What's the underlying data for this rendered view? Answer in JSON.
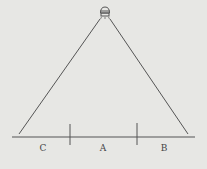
{
  "diagram": {
    "type": "light-source-illumination",
    "colors": {
      "background": "#e7e7e4",
      "line": "#555555",
      "label": "#444444"
    },
    "light_source": {
      "icon": "lamp-icon",
      "x": 105,
      "y": 12
    },
    "rays": [
      {
        "name": "left-ray",
        "x1": 100,
        "y1": 19,
        "x2": 19,
        "y2": 134
      },
      {
        "name": "right-ray",
        "x1": 110,
        "y1": 19,
        "x2": 188,
        "y2": 134
      }
    ],
    "baseline": {
      "x1": 12,
      "y1": 137,
      "x2": 195,
      "y2": 137
    },
    "ticks": [
      {
        "x": 70,
        "y1": 124,
        "y2": 145
      },
      {
        "x": 137,
        "y1": 123,
        "y2": 145
      }
    ],
    "regions": [
      {
        "label": "C",
        "x": 43,
        "y": 144
      },
      {
        "label": "A",
        "x": 103,
        "y": 144
      },
      {
        "label": "B",
        "x": 164,
        "y": 144
      }
    ]
  }
}
